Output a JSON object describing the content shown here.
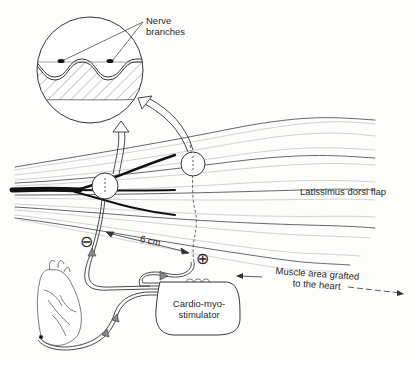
{
  "figure": {
    "labels": {
      "nerve_branches": "Nerve\nbranches",
      "nerve_line1": "Nerve",
      "nerve_line2": "branches",
      "muscle_flap": "Latissimus dorsi flap",
      "distance": "6 cm",
      "grafted_line1": "Muscle area grafted",
      "grafted_line2": "to the heart",
      "stimulator_line1": "Cardio-myo-",
      "stimulator_line2": "stimulator",
      "negative_electrode": "⊖",
      "positive_electrode": "⊕"
    },
    "elements": [
      "magnified-inset-circle",
      "muscle-fibers",
      "nerve-trunk",
      "electrode-negative",
      "electrode-positive",
      "heart",
      "stimulator-device",
      "lead-wires"
    ],
    "colors": {
      "ink": "#2a2a2a",
      "background": "#fdfdfc",
      "fiber_light": "#9a9a9a",
      "nerve": "#111111",
      "arrow_fill": "#8a8a8a"
    }
  }
}
